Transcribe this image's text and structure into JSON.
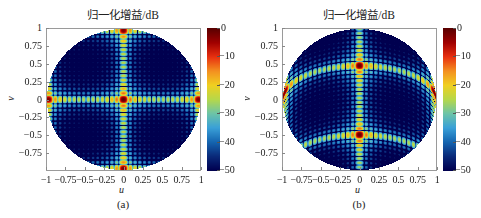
{
  "figure": {
    "panels": [
      {
        "id": "a",
        "title": "归一化增益/dB",
        "caption": "(a)",
        "xlabel": "u",
        "ylabel": "v",
        "beam_center": {
          "u": 0,
          "v": 0
        }
      },
      {
        "id": "b",
        "title": "归一化增益/dB",
        "caption": "(b)",
        "xlabel": "u",
        "ylabel": "v",
        "beam_center": {
          "u": 0,
          "v": 0.5
        }
      }
    ],
    "xticks": [
      "−1",
      "−0.75",
      "−0.5",
      "−0.25",
      "0",
      "0.25",
      "0.5",
      "0.75",
      "1"
    ],
    "yticks": [
      "1",
      "0.75",
      "0.5",
      "0.25",
      "0",
      "−0.25",
      "−0.5",
      "−0.75"
    ],
    "colorbar_ticks": [
      "0",
      "−10",
      "−20",
      "−30",
      "−40",
      "−50"
    ],
    "colormap": [
      "#00004f",
      "#0a2a7a",
      "#1565b0",
      "#3aa0d8",
      "#6cc4a8",
      "#b6d84a",
      "#f0d020",
      "#f49020",
      "#e83010",
      "#a00000",
      "#5a0000"
    ]
  },
  "chart_data": [
    {
      "type": "heatmap",
      "title": "归一化增益/dB",
      "subtitle": "(a)",
      "xlabel": "u",
      "ylabel": "v",
      "xlim": [
        -1,
        1
      ],
      "ylim": [
        -1,
        1
      ],
      "x_ticks": [
        -1,
        -0.75,
        -0.5,
        -0.25,
        0,
        0.25,
        0.5,
        0.75,
        1
      ],
      "y_ticks": [
        -0.75,
        -0.5,
        -0.25,
        0,
        0.25,
        0.5,
        0.75,
        1
      ],
      "colorbar": {
        "label": "归一化增益/dB",
        "range": [
          -50,
          0
        ],
        "ticks": [
          0,
          -10,
          -20,
          -30,
          -40,
          -50
        ],
        "colormap": "jet-like"
      },
      "region": "unit circle u^2+v^2<=1",
      "main_lobe": {
        "u": 0,
        "v": 0,
        "gain_db": 0
      },
      "description": "Broadside planar-array beam pattern: main lobe at (0,0), cross-shaped principal-plane sidelobes along u=0 and v=0 decaying to ≈ -30 to -35 dB near edges; diagonal sidelobes below -40 dB",
      "sidelobe_levels_db": {
        "first": -13,
        "principal_plane_edge": -32,
        "off_axis": -45
      },
      "grid": false
    },
    {
      "type": "heatmap",
      "title": "归一化增益/dB",
      "subtitle": "(b)",
      "xlabel": "u",
      "ylabel": "v",
      "xlim": [
        -1,
        1
      ],
      "ylim": [
        -1,
        1
      ],
      "x_ticks": [
        -1,
        -0.75,
        -0.5,
        -0.25,
        0,
        0.25,
        0.5,
        0.75,
        1
      ],
      "y_ticks": [
        -0.75,
        -0.5,
        -0.25,
        0,
        0.25,
        0.5,
        0.75,
        1
      ],
      "colorbar": {
        "label": "归一化增益/dB",
        "range": [
          -50,
          0
        ],
        "ticks": [
          0,
          -10,
          -20,
          -30,
          -40,
          -50
        ],
        "colormap": "jet-like"
      },
      "region": "unit circle u^2+v^2<=1",
      "main_lobe": {
        "u": 0,
        "v": 0.48,
        "gain_db": 0
      },
      "description": "Scanned beam pattern: main lobe steered to (0, ~0.48); horizontal sidelobe ridge bends along an arc through the main lobe; vertical ridge along u=0 weakening toward v=-0.8",
      "sidelobe_levels_db": {
        "first": -13,
        "principal_plane_edge": -30,
        "off_axis": -45
      },
      "grid": false
    }
  ]
}
